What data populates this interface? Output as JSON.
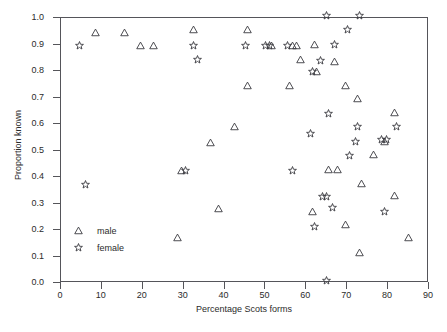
{
  "chart_data": {
    "type": "scatter",
    "title": "",
    "xlabel": "Percentage Scots forms",
    "ylabel": "Proportion known",
    "xlim": [
      0,
      90
    ],
    "ylim": [
      0.0,
      1.0
    ],
    "xticks": [
      "0",
      "10",
      "20",
      "30",
      "40",
      "50",
      "60",
      "70",
      "80",
      "90"
    ],
    "yticks": [
      "0.0",
      "0.1",
      "0.2",
      "0.3",
      "0.4",
      "0.5",
      "0.6",
      "0.7",
      "0.8",
      "0.9",
      "1.0"
    ],
    "grid": false,
    "legend_position": "lower-left-inside",
    "series": [
      {
        "name": "male",
        "marker": "triangle-up",
        "color": "#3a3a3f",
        "points": [
          [
            8.5,
            0.945
          ],
          [
            15.5,
            0.945
          ],
          [
            19.5,
            0.895
          ],
          [
            22.5,
            0.895
          ],
          [
            29.5,
            0.425
          ],
          [
            28.5,
            0.17
          ],
          [
            32.5,
            0.955
          ],
          [
            36.5,
            0.53
          ],
          [
            38.5,
            0.28
          ],
          [
            42.5,
            0.59
          ],
          [
            45.5,
            0.955
          ],
          [
            45.5,
            0.745
          ],
          [
            51.5,
            0.895
          ],
          [
            56.5,
            0.895
          ],
          [
            56.0,
            0.745
          ],
          [
            57.5,
            0.895
          ],
          [
            58.5,
            0.845
          ],
          [
            61.5,
            0.27
          ],
          [
            62.0,
            0.9
          ],
          [
            62.5,
            0.8
          ],
          [
            65.5,
            0.43
          ],
          [
            67.0,
            0.835
          ],
          [
            67.5,
            0.43
          ],
          [
            69.5,
            0.22
          ],
          [
            69.5,
            0.745
          ],
          [
            72.5,
            0.695
          ],
          [
            73.0,
            0.115
          ],
          [
            73.5,
            0.375
          ],
          [
            76.5,
            0.485
          ],
          [
            79.0,
            0.535
          ],
          [
            81.5,
            0.645
          ],
          [
            81.5,
            0.33
          ],
          [
            85.0,
            0.17
          ]
        ]
      },
      {
        "name": "female",
        "marker": "star",
        "color": "#3a3a3f",
        "points": [
          [
            4.5,
            0.895
          ],
          [
            6.0,
            0.37
          ],
          [
            32.5,
            0.895
          ],
          [
            33.5,
            0.845
          ],
          [
            30.5,
            0.425
          ],
          [
            45.0,
            0.895
          ],
          [
            50.0,
            0.895
          ],
          [
            51.0,
            0.895
          ],
          [
            55.5,
            0.895
          ],
          [
            56.5,
            0.425
          ],
          [
            61.5,
            0.8
          ],
          [
            61.0,
            0.565
          ],
          [
            62.0,
            0.215
          ],
          [
            63.5,
            0.84
          ],
          [
            64.0,
            0.325
          ],
          [
            65.0,
            0.325
          ],
          [
            65.0,
            0.01
          ],
          [
            65.5,
            0.64
          ],
          [
            66.5,
            0.285
          ],
          [
            67.0,
            0.9
          ],
          [
            70.0,
            0.955
          ],
          [
            73.0,
            1.01
          ],
          [
            65.0,
            1.01
          ],
          [
            72.5,
            0.59
          ],
          [
            72.0,
            0.535
          ],
          [
            70.5,
            0.48
          ],
          [
            78.5,
            0.54
          ],
          [
            79.5,
            0.54
          ],
          [
            79.0,
            0.27
          ],
          [
            82.0,
            0.59
          ]
        ]
      }
    ]
  },
  "legend": {
    "items": [
      {
        "label": "male",
        "marker": "triangle-up"
      },
      {
        "label": "female",
        "marker": "star"
      }
    ]
  }
}
